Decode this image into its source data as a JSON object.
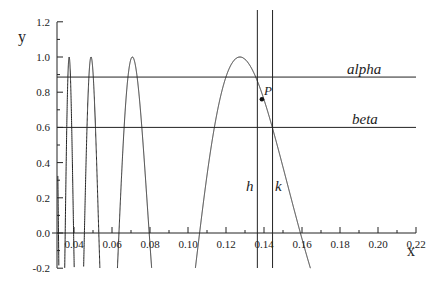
{
  "chart_data": {
    "type": "line",
    "function": "y = sin(1/x)",
    "xlabel": "x",
    "ylabel": "y",
    "xlim": [
      0.031,
      0.22
    ],
    "ylim": [
      -0.2,
      1.2
    ],
    "xticks": [
      "0.04",
      "0.06",
      "0.08",
      "0.10",
      "0.12",
      "0.14",
      "0.16",
      "0.18",
      "0.20",
      "0.22"
    ],
    "yticks": [
      "1.2",
      "1.0",
      "0.8",
      "0.6",
      "0.4",
      "0.2",
      "0.0",
      "-0.2"
    ],
    "horizontal_lines": [
      {
        "name": "alpha",
        "y": 0.886
      },
      {
        "name": "beta",
        "y": 0.6
      }
    ],
    "vertical_lines": [
      {
        "name": "h",
        "x": 0.1365
      },
      {
        "name": "k",
        "x": 0.1445
      }
    ],
    "point": {
      "name": "P",
      "x": 0.1389,
      "y": 0.76
    },
    "grid": false
  },
  "labels": {
    "x_axis": "x",
    "y_axis": "y",
    "alpha": "alpha",
    "beta": "beta",
    "h": "h",
    "k": "k",
    "P": "P"
  }
}
